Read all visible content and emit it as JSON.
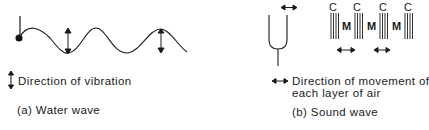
{
  "water_wave": {
    "legend_text": "Direction of vibration",
    "caption": "(a) Water wave",
    "icons": [
      "vibrating-source-dot",
      "sine-wave",
      "vertical-double-arrow"
    ]
  },
  "sound_wave": {
    "layer_labels_top": [
      "C",
      "C",
      "C",
      "C"
    ],
    "layer_labels_mid": [
      "M",
      "M",
      "M"
    ],
    "legend_line1": "Direction of movement of",
    "legend_line2": "each layer of air",
    "caption": "(b) Sound wave",
    "icons": [
      "tuning-fork",
      "horizontal-double-arrow",
      "compression-lines"
    ]
  },
  "colors": {
    "ink": "#1a1a1a",
    "background": "#ffffff"
  }
}
